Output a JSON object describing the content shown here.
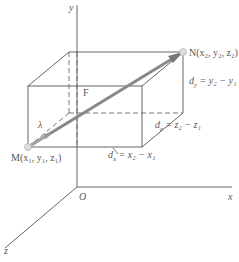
{
  "diagram": {
    "axes": {
      "x_label": "x",
      "y_label": "y",
      "z_label": "z",
      "origin_label": "O"
    },
    "points": {
      "M": "M(x₁, y₁, z₁)",
      "N": "N(x₂, y₂, z₂)"
    },
    "vectors": {
      "force": "F",
      "unit": "λ"
    },
    "dimensions": {
      "dx": "dₓ = x₂ − x₁",
      "dy": "dᵧ = y₂ − y₁",
      "dz": "dₓ = z₂ − z₁"
    },
    "dimension_parts": {
      "dx_d": "d",
      "dx_sub": "x",
      "dx_rhs": "= x₂ − x₁",
      "dy_d": "d",
      "dy_sub": "y",
      "dy_rhs": "= y₂ − y₁",
      "dz_d": "d",
      "dz_sub": "z",
      "dz_rhs": "= z₂ − z₁"
    },
    "colors": {
      "line": "#555555",
      "arrow": "#777777",
      "point": "#dddddd"
    }
  }
}
